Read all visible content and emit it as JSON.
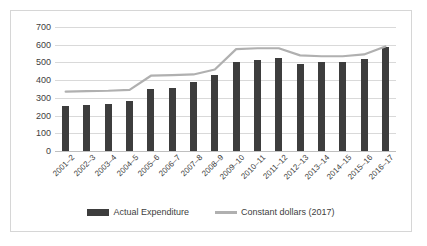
{
  "chart_data": {
    "type": "bar",
    "title": "",
    "subtitle": "",
    "xlabel": "",
    "ylabel": "",
    "ylim": [
      0,
      700
    ],
    "ytick_step": 100,
    "yticks": [
      "0",
      "100",
      "200",
      "300",
      "400",
      "500",
      "600",
      "700"
    ],
    "grid": true,
    "legend_position": "bottom",
    "categories": [
      "2001–2",
      "2002–3",
      "2003–4",
      "2004–5",
      "2005–6",
      "2006–7",
      "2007–8",
      "2008–9",
      "2009–10",
      "2010–11",
      "2011–12",
      "2012–13",
      "2013–14",
      "2014–15",
      "2015–16",
      "2016–17"
    ],
    "series": [
      {
        "name": "Actual Expenditure",
        "type": "bar",
        "color": "#3d3d3d",
        "values": [
          255,
          258,
          265,
          280,
          350,
          355,
          390,
          430,
          505,
          515,
          525,
          490,
          500,
          500,
          520,
          585
        ]
      },
      {
        "name": "Constant dollars (2017)",
        "type": "line",
        "color": "#b0b0b0",
        "values": [
          335,
          338,
          340,
          345,
          425,
          428,
          432,
          460,
          575,
          580,
          580,
          540,
          535,
          535,
          545,
          590
        ]
      }
    ]
  },
  "legend": {
    "entries": [
      {
        "label": "Actual Expenditure",
        "marker": "bar-swatch",
        "color": "#3d3d3d"
      },
      {
        "label": "Constant dollars (2017)",
        "marker": "line-swatch",
        "color": "#b0b0b0"
      }
    ]
  },
  "colors": {
    "bar": "#3d3d3d",
    "line": "#b0b0b0",
    "gridline": "#d9d9d9",
    "axis_text": "#404040",
    "frame_border": "#d6d6d6",
    "background": "#ffffff"
  }
}
